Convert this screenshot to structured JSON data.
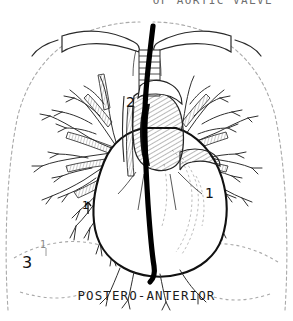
{
  "figure": {
    "kind": "medical-anatomical-illustration",
    "view": "postero-anterior chest projection",
    "bottom_caption": "POSTERO-ANTERIOR",
    "top_caption": "OF AORTIC VALVE",
    "top_caption_note": "clipped at top edge of image",
    "background_color": "#ffffff",
    "ink_color": "#111111",
    "faint_ink_color": "#9a9a9a",
    "catheter_color": "#000000"
  },
  "labels": [
    {
      "id": "label-1-right",
      "text": "1",
      "meaning": "right heart border",
      "x": 205,
      "y": 186
    },
    {
      "id": "label-2-aorta",
      "text": "2",
      "meaning": "aortic arch / ascending aorta",
      "x": 126,
      "y": 95
    },
    {
      "id": "label-3-diaph",
      "text": "3",
      "meaning": "diaphragm / costophrenic angle",
      "x": 22,
      "y": 255
    },
    {
      "id": "label-1-left",
      "text": "1",
      "meaning": "left hilar marker",
      "x": 82,
      "y": 200
    },
    {
      "id": "label-1-small",
      "text": "1",
      "meaning": "faint diaphragm tick",
      "x": 40,
      "y": 240
    }
  ],
  "legend_keys": {
    "1": "heart border",
    "2": "aorta",
    "3": "diaphragm"
  },
  "structures": [
    "chest wall outline (dashed)",
    "clavicles",
    "trachea with cartilage rings",
    "aortic arch",
    "ascending aorta",
    "pulmonary artery",
    "right pulmonary vascular tree",
    "left pulmonary vascular tree",
    "cardiac silhouette",
    "diaphragm (dashed)",
    "catheter / radio-opaque line"
  ]
}
